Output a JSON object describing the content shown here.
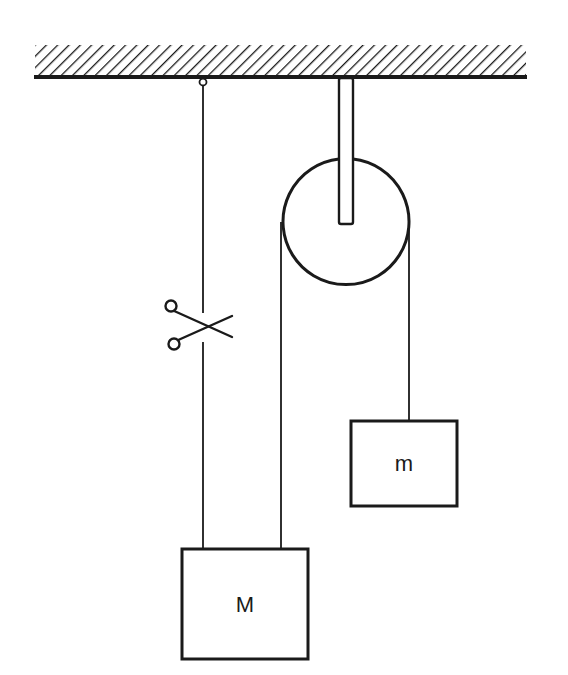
{
  "diagram": {
    "type": "pulley-system",
    "labels": {
      "large_mass": "M",
      "small_mass": "m"
    },
    "components": {
      "ceiling": "hatched-ceiling",
      "pulley": "fixed-pulley",
      "left_string": "support-string-with-cut",
      "cut_symbol": "scissors-icon"
    },
    "colors": {
      "ink": "#1a1a1a",
      "background": "#ffffff"
    }
  }
}
